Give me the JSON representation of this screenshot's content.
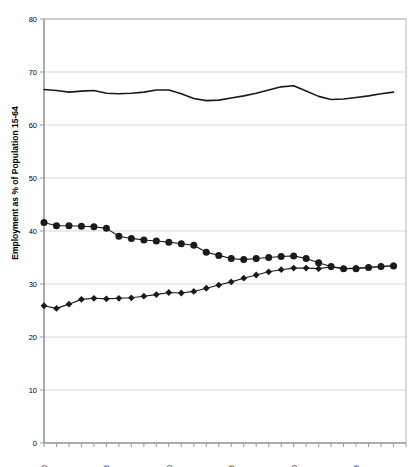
{
  "chart_data": {
    "type": "line",
    "title": "",
    "xlabel": "",
    "ylabel": "Employment as % of Population 15-64",
    "ylim": [
      0,
      80
    ],
    "ytick_step": 10,
    "yticks": [
      "0",
      "10",
      "20",
      "30",
      "40",
      "50",
      "60",
      "70",
      "80"
    ],
    "xlim": [
      1970,
      1999
    ],
    "xtick_labels": [
      "1970",
      "1975",
      "1980",
      "1985",
      "1990",
      "1995"
    ],
    "xtick_label_years": [
      1970,
      1975,
      1980,
      1985,
      1990,
      1995
    ],
    "grid": "horizontal",
    "legend_position": "none",
    "x": [
      1970,
      1971,
      1972,
      1973,
      1974,
      1975,
      1976,
      1977,
      1978,
      1979,
      1980,
      1981,
      1982,
      1983,
      1984,
      1985,
      1986,
      1987,
      1988,
      1989,
      1990,
      1991,
      1992,
      1993,
      1994,
      1995,
      1996,
      1997,
      1998
    ],
    "series": [
      {
        "name": "Total",
        "marker": "none",
        "values": [
          66.7,
          66.5,
          66.2,
          66.4,
          66.5,
          66.0,
          65.9,
          66.0,
          66.2,
          66.6,
          66.6,
          65.9,
          65.0,
          64.6,
          64.7,
          65.1,
          65.5,
          66.0,
          66.6,
          67.2,
          67.4,
          66.4,
          65.4,
          64.8,
          64.9,
          65.2,
          65.5,
          65.9,
          66.2
        ]
      },
      {
        "name": "Men",
        "marker": "circle",
        "values": [
          41.6,
          41.0,
          41.0,
          40.9,
          40.8,
          40.5,
          39.0,
          38.6,
          38.3,
          38.1,
          37.9,
          37.6,
          37.3,
          36.0,
          35.4,
          34.8,
          34.6,
          34.8,
          35.0,
          35.2,
          35.3,
          34.8,
          34.0,
          33.3,
          32.9,
          32.9,
          33.1,
          33.3,
          33.4
        ]
      },
      {
        "name": "Women",
        "marker": "diamond",
        "values": [
          25.9,
          25.4,
          26.2,
          27.1,
          27.3,
          27.2,
          27.3,
          27.4,
          27.7,
          28.0,
          28.4,
          28.3,
          28.6,
          29.2,
          29.8,
          30.4,
          31.1,
          31.7,
          32.3,
          32.7,
          33.0,
          33.0,
          32.9,
          33.2,
          32.9,
          33.0,
          33.1,
          33.3,
          33.5
        ]
      }
    ]
  }
}
